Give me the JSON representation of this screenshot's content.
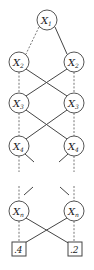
{
  "diagram": {
    "type": "binary decision diagram",
    "nodes": [
      {
        "id": "x1",
        "var": "X",
        "sub": "1",
        "cx": 47,
        "cy": 20
      },
      {
        "id": "x2l",
        "var": "X",
        "sub": "2",
        "cx": 19,
        "cy": 62
      },
      {
        "id": "x2r",
        "var": "X",
        "sub": "2",
        "cx": 74,
        "cy": 62
      },
      {
        "id": "x3l",
        "var": "X",
        "sub": "3",
        "cx": 19,
        "cy": 103
      },
      {
        "id": "x3r",
        "var": "X",
        "sub": "3",
        "cx": 74,
        "cy": 103
      },
      {
        "id": "x4l",
        "var": "X",
        "sub": "4",
        "cx": 19,
        "cy": 146
      },
      {
        "id": "x4r",
        "var": "X",
        "sub": "4",
        "cx": 74,
        "cy": 146
      },
      {
        "id": "xnl",
        "var": "X",
        "sub": "n",
        "cx": 19,
        "cy": 211
      },
      {
        "id": "xnr",
        "var": "X",
        "sub": "n",
        "cx": 74,
        "cy": 211
      }
    ],
    "terminals": [
      {
        "id": "t_left",
        "label": ".4"
      },
      {
        "id": "t_right",
        "label": ".2"
      }
    ],
    "edge_styles": {
      "dashed": "low/0-branch",
      "solid": "high/1-branch"
    }
  }
}
